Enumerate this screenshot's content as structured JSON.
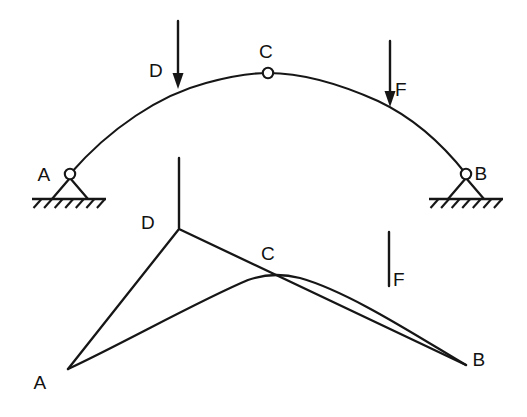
{
  "figure": {
    "ink_color": "#161616",
    "background_color": "#ffffff"
  },
  "upper_diagram": {
    "name": "three-hinged-arch",
    "labels": {
      "support_a": "A",
      "support_b": "B",
      "crown_hinge": "C",
      "load_d": "D",
      "load_f": "F"
    },
    "label_positions": {
      "support_a": {
        "x": 44,
        "y": 181
      },
      "support_b": {
        "x": 481,
        "y": 180
      },
      "crown_hinge": {
        "x": 266,
        "y": 58
      },
      "load_d": {
        "x": 156,
        "y": 77
      },
      "load_f": {
        "x": 401,
        "y": 96
      }
    },
    "arch": {
      "start": {
        "x": 70,
        "y": 174
      },
      "end": {
        "x": 466,
        "y": 174
      },
      "crown": {
        "x": 268,
        "y": 73
      },
      "path": "M 70 174 C 110 128, 160 95, 206 83 C 235 75, 252 73, 268 73 C 300 73, 340 84, 378 101 C 414 118, 444 146, 466 174"
    },
    "hinges": [
      {
        "name": "crown-hinge-c",
        "x": 268,
        "y": 73,
        "r": 5.2
      },
      {
        "name": "pin-hinge-a",
        "x": 70,
        "y": 174,
        "r": 5.2
      },
      {
        "name": "pin-hinge-b",
        "x": 466,
        "y": 174,
        "r": 5.2
      }
    ],
    "supports": [
      {
        "name": "pin-support-a",
        "apex": {
          "x": 70,
          "y": 178
        },
        "base_left": {
          "x": 52,
          "y": 199
        },
        "base_right": {
          "x": 88,
          "y": 199
        },
        "ground": {
          "x1": 32,
          "x2": 106,
          "y": 199
        },
        "hatch_count": 7
      },
      {
        "name": "pin-support-b",
        "apex": {
          "x": 466,
          "y": 178
        },
        "base_left": {
          "x": 448,
          "y": 199
        },
        "base_right": {
          "x": 484,
          "y": 199
        },
        "ground": {
          "x1": 429,
          "x2": 503,
          "y": 199
        },
        "hatch_count": 7
      }
    ],
    "loads": [
      {
        "name": "load-arrow-d",
        "label": "D",
        "x": 178,
        "y_start": 21,
        "y_tip": 89,
        "head_width": 11,
        "head_length": 16
      },
      {
        "name": "load-arrow-f",
        "label": "F",
        "x": 390,
        "y_start": 41,
        "y_tip": 107,
        "head_width": 11,
        "head_length": 16
      }
    ]
  },
  "lower_diagram": {
    "name": "deflected-shape",
    "labels": {
      "point_a": "A",
      "point_b": "B",
      "point_c": "C",
      "point_d": "D",
      "point_f": "F"
    },
    "label_positions": {
      "point_a": {
        "x": 40,
        "y": 389
      },
      "point_b": {
        "x": 479,
        "y": 366
      },
      "point_c": {
        "x": 268,
        "y": 260
      },
      "point_d": {
        "x": 148,
        "y": 229
      },
      "point_f": {
        "x": 399,
        "y": 286
      }
    },
    "nodes": {
      "a": {
        "x": 68,
        "y": 369
      },
      "b": {
        "x": 466,
        "y": 365
      },
      "c": {
        "x": 273,
        "y": 274
      },
      "d": {
        "x": 179,
        "y": 229
      }
    },
    "straight_path": "M 68 369 L 179 229 L 466 365",
    "curve_path": "M 68 369 C 120 345, 200 300, 248 280 C 262 275, 280 273, 300 278 C 350 292, 420 338, 466 365",
    "markers": [
      {
        "name": "load-tick-d",
        "label": "D",
        "x": 179,
        "y_start": 158,
        "y_end": 228
      },
      {
        "name": "load-tick-f",
        "label": "F",
        "x": 389,
        "y_start": 232,
        "y_end": 286
      }
    ]
  }
}
